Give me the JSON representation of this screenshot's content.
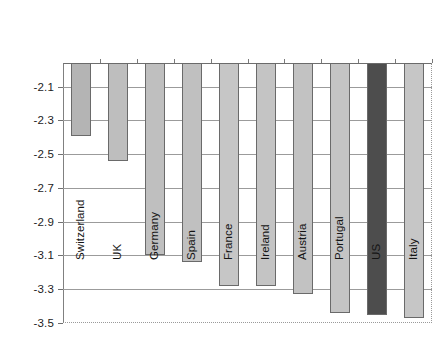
{
  "chart_data": {
    "type": "bar",
    "title": "",
    "subtitle": "",
    "xlabel": "",
    "ylabel": "",
    "categories": [
      "Switzerland",
      "UK",
      "Germany",
      "Spain",
      "France",
      "Ireland",
      "Austria",
      "Portugal",
      "US",
      "Italy"
    ],
    "values": [
      -2.39,
      -2.54,
      -3.1,
      -3.14,
      -3.28,
      -3.28,
      -3.33,
      -3.44,
      -3.45,
      -3.47
    ],
    "ylim": [
      -3.5,
      -1.96
    ],
    "baseline": -1.96,
    "ytick_labels": [
      "-2.1",
      "-2.3",
      "-2.5",
      "-2.7",
      "-2.9",
      "-3.1",
      "-3.3",
      "-3.5"
    ],
    "yticks": [
      -2.1,
      -2.3,
      -2.5,
      -2.7,
      -2.9,
      -3.1,
      -3.3,
      -3.5
    ],
    "grid": true,
    "grid_axis": "y",
    "legend": "none",
    "orientation": "vertical",
    "bar_colors": [
      "#b4b4b4",
      "#bebebe",
      "#bfbfbf",
      "#c0c0c0",
      "#c6c6c6",
      "#c4c4c4",
      "#c2c2c2",
      "#c4c4c4",
      "#4d4d4d",
      "#c6c6c6"
    ],
    "highlight_category": "US",
    "highlight_color": "#4d4d4d",
    "default_bar_color": "#c0c0c0",
    "bar_edge_color": "#6a6a6a",
    "gridline_color": "#9b9b9b",
    "axis_color": "#808080",
    "background_color": "#ffffff",
    "series": [
      {
        "name": "value",
        "values": [
          -2.39,
          -2.54,
          -3.1,
          -3.14,
          -3.28,
          -3.28,
          -3.33,
          -3.44,
          -3.45,
          -3.47
        ]
      }
    ]
  }
}
